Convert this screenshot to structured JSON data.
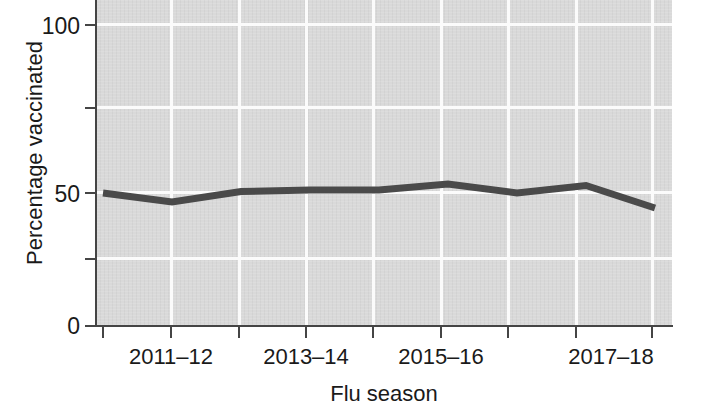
{
  "chart_data": {
    "type": "line",
    "title": "",
    "xlabel": "Flu season",
    "ylabel": "Percentage vaccinated",
    "ylim": [
      0,
      108
    ],
    "ytick_values": [
      0,
      25,
      50,
      75,
      100
    ],
    "ytick_labels": [
      "0",
      "",
      "50",
      "",
      "100"
    ],
    "grid": true,
    "legend": "none",
    "categories": [
      "2010–11",
      "2011–12",
      "2012–13",
      "2013–14",
      "2014–15",
      "2015–16",
      "2016–17",
      "2017–18",
      "2018–19"
    ],
    "xtick_labels_visible": [
      "2011–12",
      "2013–14",
      "2015–16",
      "2017–18"
    ],
    "series": [
      {
        "name": "Percentage vaccinated",
        "color": "#4a4a4a",
        "values": [
          44,
          41,
          44.5,
          45,
          45,
          47,
          44,
          46.5,
          39
        ]
      }
    ],
    "colors": {
      "line": "#4a4a4a",
      "plot_background": "#d9d9d9",
      "gridline": "#fbfbfb",
      "axis": "#454545",
      "text": "#1a1a1a",
      "page_background": "#ffffff"
    }
  },
  "axes": {
    "y_title": "Percentage vaccinated",
    "x_title": "Flu season",
    "y_ticks": [
      {
        "label": "100",
        "value": 100
      },
      {
        "label": "",
        "value": 75
      },
      {
        "label": "50",
        "value": 50
      },
      {
        "label": "",
        "value": 25
      },
      {
        "label": "0",
        "value": 0
      }
    ],
    "x_ticks": [
      {
        "label": ""
      },
      {
        "label": "2011–12"
      },
      {
        "label": ""
      },
      {
        "label": "2013–14"
      },
      {
        "label": ""
      },
      {
        "label": "2015–16"
      },
      {
        "label": ""
      },
      {
        "label": "2017–18"
      },
      {
        "label": ""
      }
    ]
  }
}
